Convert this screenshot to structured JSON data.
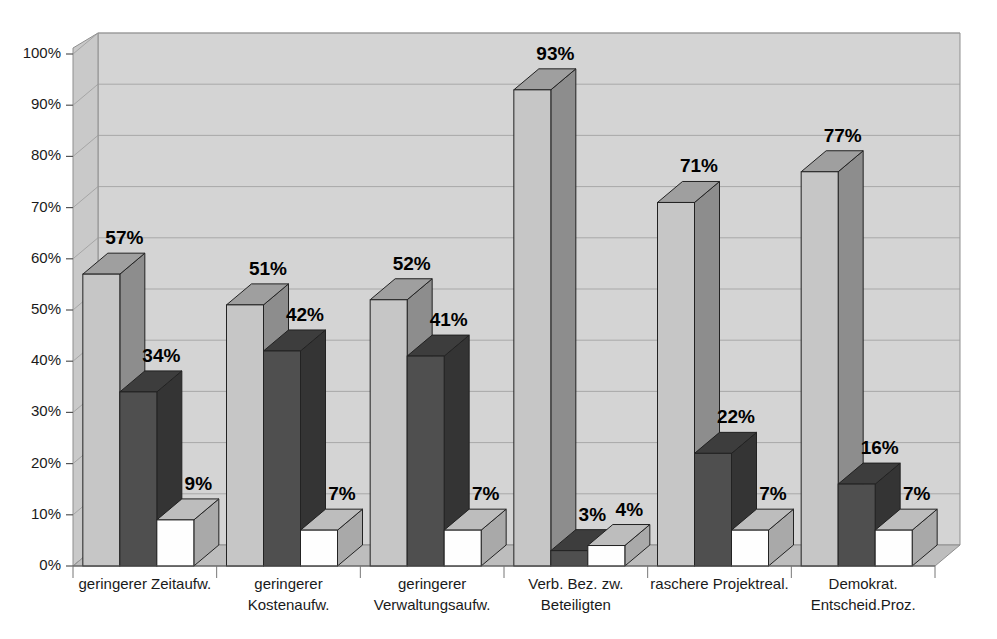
{
  "chart_data": {
    "type": "bar",
    "title": "",
    "subtitle": "",
    "xlabel": "",
    "ylabel": "",
    "ylim": [
      0,
      100
    ],
    "ytick_labels": [
      "0%",
      "10%",
      "20%",
      "30%",
      "40%",
      "50%",
      "60%",
      "70%",
      "80%",
      "90%",
      "100%"
    ],
    "ytick_values": [
      0,
      10,
      20,
      30,
      40,
      50,
      60,
      70,
      80,
      90,
      100
    ],
    "grid": true,
    "legend": "none",
    "three_d": true,
    "value_suffix": "%",
    "categories": [
      "geringerer Zeitaufw.",
      "geringerer Kostenaufw.",
      "geringerer Verwaltungsaufw.",
      "Verb. Bez. zw. Beteiligten",
      "raschere Projektreal.",
      "Demokrat. Entscheid.Proz."
    ],
    "category_lines": [
      [
        "geringerer Zeitaufw."
      ],
      [
        "geringerer",
        "Kostenaufw."
      ],
      [
        "geringerer",
        "Verwaltungsaufw."
      ],
      [
        "Verb. Bez. zw.",
        "Beteiligten"
      ],
      [
        "raschere Projektreal."
      ],
      [
        "Demokrat.",
        "Entscheid.Proz."
      ]
    ],
    "series": [
      {
        "name": "series-1",
        "color": "#c6c6c6",
        "side_color": "#8d8d8d",
        "top_color": "#9f9f9f",
        "values": [
          57,
          51,
          52,
          93,
          71,
          77
        ],
        "labels": [
          "57%",
          "51%",
          "52%",
          "93%",
          "71%",
          "77%"
        ]
      },
      {
        "name": "series-2",
        "color": "#4f4f4f",
        "side_color": "#343434",
        "top_color": "#3d3d3d",
        "values": [
          34,
          42,
          41,
          3,
          22,
          16
        ],
        "labels": [
          "34%",
          "42%",
          "41%",
          "3%",
          "22%",
          "16%"
        ]
      },
      {
        "name": "series-3",
        "color": "#fefefe",
        "side_color": "#a9a9a9",
        "top_color": "#bdbdbd",
        "values": [
          9,
          7,
          7,
          4,
          7,
          7
        ],
        "labels": [
          "9%",
          "7%",
          "7%",
          "4%",
          "7%",
          "7%"
        ]
      }
    ]
  },
  "palette": {
    "plot_background": "#d4d4d4",
    "wall_left": "#c9c9c9",
    "floor": "#bdbdbd",
    "page_background": "#ffffff",
    "grid": "#9a9a9a",
    "axis_text": "#1a1a1a",
    "value_text": "#000000"
  }
}
